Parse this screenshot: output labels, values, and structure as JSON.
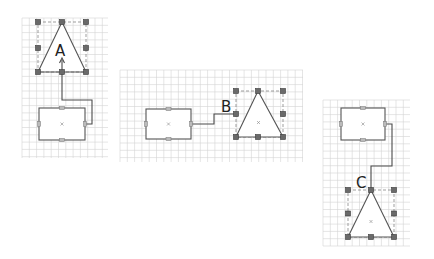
{
  "diagram": {
    "title": "",
    "panels": [
      {
        "id": "A",
        "label": "A",
        "description": "rectangle connected to selected triangle via orthogonal edge entering triangle interior from below",
        "shapes": [
          "rectangle",
          "triangle"
        ],
        "selected": "triangle"
      },
      {
        "id": "B",
        "label": "B",
        "description": "rectangle connected to left-middle handle of selected triangle",
        "shapes": [
          "rectangle",
          "triangle"
        ],
        "selected": "triangle"
      },
      {
        "id": "C",
        "label": "C",
        "description": "rectangle connected to apex of selected triangle below it",
        "shapes": [
          "rectangle",
          "triangle"
        ],
        "selected": "triangle"
      }
    ],
    "colors": {
      "grid": "#d4d4d4",
      "stroke": "#555555",
      "handle": "#6a6a6a",
      "background": "#ffffff"
    }
  }
}
